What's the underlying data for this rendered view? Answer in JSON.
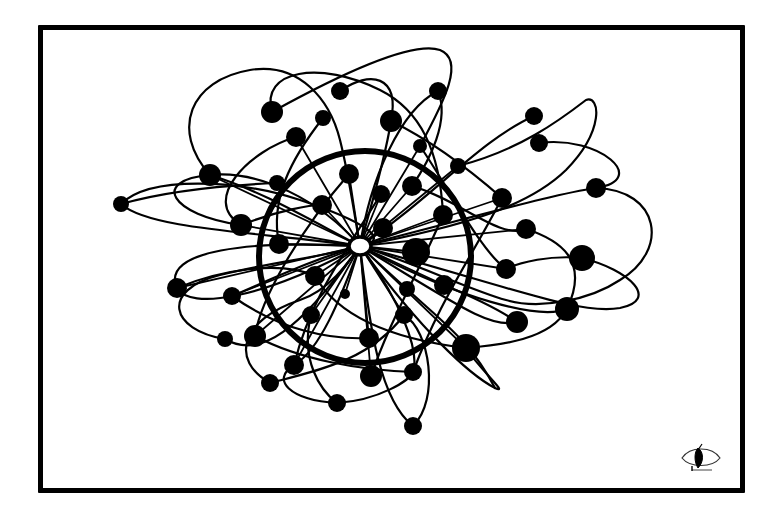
{
  "illustration": {
    "title": "Network constellation drawing",
    "style": "hand-drawn black ink on white",
    "colors": {
      "ink": "#000000",
      "paper": "#ffffff"
    },
    "frame": {
      "x": 38,
      "y": 25,
      "width": 702,
      "height": 463,
      "stroke_width": 5
    },
    "ring": {
      "cx": 365,
      "cy": 257,
      "r": 106,
      "stroke_width": 6
    },
    "hub": {
      "cx": 360,
      "cy": 246,
      "rx": 11,
      "ry": 9,
      "fill": "hollow"
    },
    "signature": {
      "icon": "eye-leaf-icon",
      "x": 702,
      "y": 458
    }
  },
  "nodes": [
    {
      "x": 121,
      "y": 204,
      "r": 8
    },
    {
      "x": 210,
      "y": 175,
      "r": 11
    },
    {
      "x": 241,
      "y": 225,
      "r": 11
    },
    {
      "x": 272,
      "y": 112,
      "r": 11
    },
    {
      "x": 296,
      "y": 137,
      "r": 10
    },
    {
      "x": 340,
      "y": 91,
      "r": 9
    },
    {
      "x": 323,
      "y": 118,
      "r": 8
    },
    {
      "x": 391,
      "y": 121,
      "r": 11
    },
    {
      "x": 438,
      "y": 91,
      "r": 9
    },
    {
      "x": 277,
      "y": 183,
      "r": 8
    },
    {
      "x": 322,
      "y": 205,
      "r": 10
    },
    {
      "x": 349,
      "y": 174,
      "r": 10
    },
    {
      "x": 381,
      "y": 194,
      "r": 9
    },
    {
      "x": 412,
      "y": 186,
      "r": 10
    },
    {
      "x": 420,
      "y": 146,
      "r": 7
    },
    {
      "x": 458,
      "y": 166,
      "r": 8
    },
    {
      "x": 534,
      "y": 116,
      "r": 9
    },
    {
      "x": 539,
      "y": 143,
      "r": 9
    },
    {
      "x": 443,
      "y": 215,
      "r": 10
    },
    {
      "x": 502,
      "y": 198,
      "r": 10
    },
    {
      "x": 596,
      "y": 188,
      "r": 10
    },
    {
      "x": 526,
      "y": 229,
      "r": 10
    },
    {
      "x": 582,
      "y": 258,
      "r": 13
    },
    {
      "x": 383,
      "y": 228,
      "r": 10
    },
    {
      "x": 416,
      "y": 252,
      "r": 14
    },
    {
      "x": 279,
      "y": 244,
      "r": 10
    },
    {
      "x": 506,
      "y": 269,
      "r": 10
    },
    {
      "x": 567,
      "y": 309,
      "r": 12
    },
    {
      "x": 177,
      "y": 288,
      "r": 10
    },
    {
      "x": 232,
      "y": 296,
      "r": 9
    },
    {
      "x": 315,
      "y": 276,
      "r": 10
    },
    {
      "x": 345,
      "y": 294,
      "r": 5
    },
    {
      "x": 407,
      "y": 289,
      "r": 8
    },
    {
      "x": 444,
      "y": 285,
      "r": 10
    },
    {
      "x": 517,
      "y": 322,
      "r": 11
    },
    {
      "x": 225,
      "y": 339,
      "r": 8
    },
    {
      "x": 255,
      "y": 336,
      "r": 11
    },
    {
      "x": 311,
      "y": 315,
      "r": 9
    },
    {
      "x": 404,
      "y": 315,
      "r": 9
    },
    {
      "x": 466,
      "y": 348,
      "r": 14
    },
    {
      "x": 294,
      "y": 365,
      "r": 10
    },
    {
      "x": 369,
      "y": 338,
      "r": 10
    },
    {
      "x": 270,
      "y": 383,
      "r": 9
    },
    {
      "x": 371,
      "y": 376,
      "r": 11
    },
    {
      "x": 413,
      "y": 372,
      "r": 9
    },
    {
      "x": 337,
      "y": 403,
      "r": 9
    },
    {
      "x": 413,
      "y": 426,
      "r": 9
    }
  ]
}
